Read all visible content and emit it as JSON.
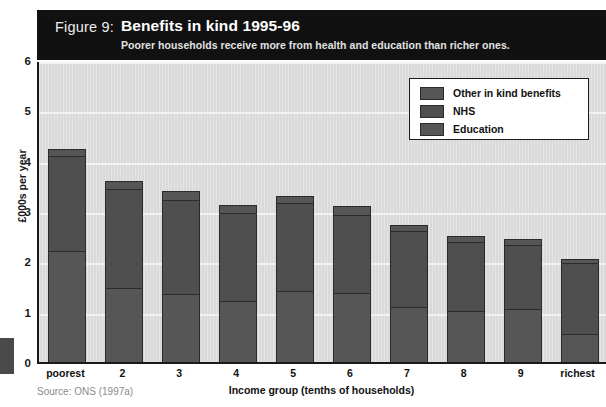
{
  "figure": {
    "label": "Figure 9:",
    "title": "Benefits in kind 1995-96",
    "subtitle": "Poorer households receive more from health and education than richer ones.",
    "source": "Source: ONS (1997a)"
  },
  "legend": {
    "items": [
      {
        "label": "Other in kind benefits",
        "color": "#565656"
      },
      {
        "label": "NHS",
        "color": "#4f4f4f"
      },
      {
        "label": "Education",
        "color": "#565656"
      }
    ]
  },
  "axes": {
    "y_ticks": [
      "6",
      "5",
      "4",
      "3",
      "2",
      "1",
      "0"
    ],
    "y_title": "£000s per year",
    "x_title": "Income group (tenths of households)"
  },
  "chart_data": {
    "type": "bar",
    "stacked": true,
    "title": "Benefits in kind 1995-96",
    "subtitle": "Poorer households receive more from health and education than richer ones.",
    "xlabel": "Income group (tenths of households)",
    "ylabel": "£000s per year",
    "ylim": [
      0,
      6
    ],
    "ytick_step": 1,
    "grid": true,
    "legend_position": "top-right",
    "categories": [
      "poorest",
      "2",
      "3",
      "4",
      "5",
      "6",
      "7",
      "8",
      "9",
      "richest"
    ],
    "series": [
      {
        "name": "Education",
        "values": [
          2.22,
          1.5,
          1.38,
          1.24,
          1.43,
          1.4,
          1.12,
          1.04,
          1.08,
          0.58
        ]
      },
      {
        "name": "NHS",
        "values": [
          1.9,
          1.95,
          1.85,
          1.74,
          1.74,
          1.55,
          1.5,
          1.36,
          1.27,
          1.4
        ]
      },
      {
        "name": "Other in kind benefits",
        "values": [
          0.16,
          0.19,
          0.2,
          0.18,
          0.17,
          0.18,
          0.15,
          0.14,
          0.14,
          0.1
        ]
      }
    ],
    "totals": [
      4.28,
      3.64,
      3.43,
      3.16,
      3.34,
      3.13,
      2.77,
      2.54,
      2.49,
      2.08
    ]
  }
}
